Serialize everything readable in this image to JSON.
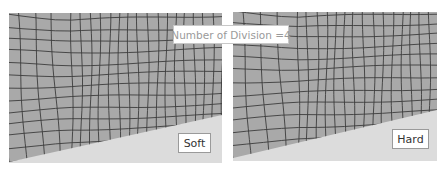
{
  "title": {
    "text": "Number of Division =4"
  },
  "panels": [
    {
      "id": "soft",
      "label": "Soft"
    },
    {
      "id": "hard",
      "label": "Hard"
    }
  ],
  "colors": {
    "mesh_fill": "#a9a9a9",
    "mesh_line": "#3c3c3c",
    "lower_region": "#dcdcdc",
    "background": "#ffffff"
  }
}
